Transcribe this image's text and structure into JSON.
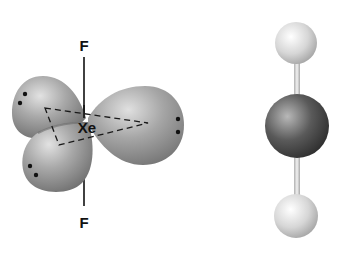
{
  "diagram": {
    "left_model": {
      "name": "electron-domain model",
      "central_atom": "Xe",
      "axial_atoms": [
        "F",
        "F"
      ],
      "lone_pairs": 3,
      "lone_pair_marker": "••"
    },
    "right_model": {
      "name": "ball-and-stick model",
      "atoms": [
        "F",
        "Xe",
        "F"
      ],
      "shape": "linear"
    },
    "colors": {
      "lobe": "#9a9a9a",
      "central_atom": "#4a4a4a",
      "terminal_atom": "#d9d9d9",
      "bond": "#cfcfcf"
    }
  }
}
